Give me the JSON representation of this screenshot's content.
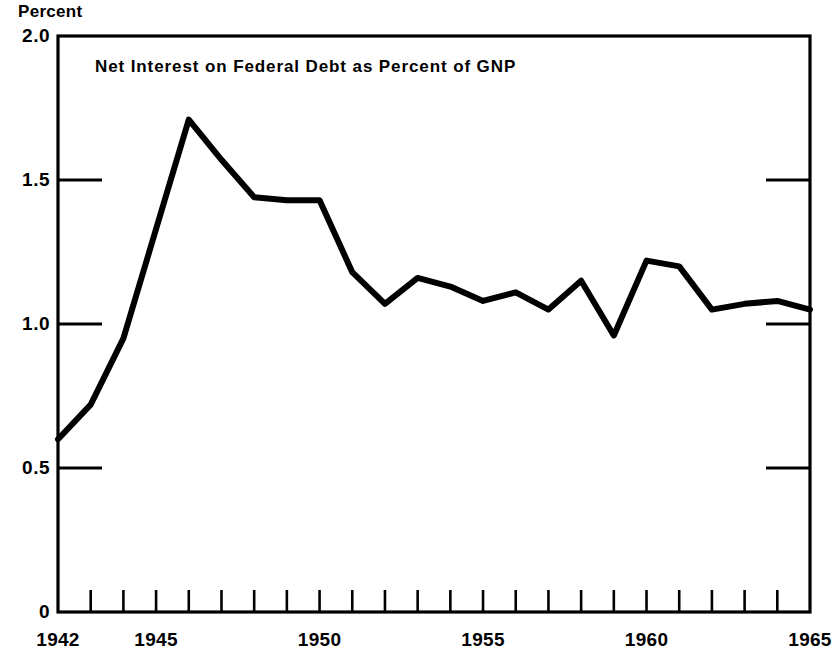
{
  "chart_data": {
    "type": "line",
    "title": "Net Interest on Federal Debt as Percent of GNP",
    "xlabel": "",
    "ylabel": "Percent",
    "ylim": [
      0,
      2.0
    ],
    "xlim": [
      1942,
      1965
    ],
    "grid": false,
    "legend": null,
    "y_ticks": [
      "2.0",
      "1.5",
      "1.0",
      "0.5",
      "0"
    ],
    "y_tick_values": [
      2.0,
      1.5,
      1.0,
      0.5,
      0
    ],
    "x_ticks": [
      "1942",
      "1945",
      "1950",
      "1955",
      "1960",
      "1965"
    ],
    "x_tick_values": [
      1942,
      1945,
      1950,
      1955,
      1960,
      1965
    ],
    "x_minor_tick_values": [
      1942,
      1943,
      1944,
      1945,
      1946,
      1947,
      1948,
      1949,
      1950,
      1951,
      1952,
      1953,
      1954,
      1955,
      1956,
      1957,
      1958,
      1959,
      1960,
      1961,
      1962,
      1963,
      1964,
      1965
    ],
    "line_color": "#000000",
    "series": [
      {
        "name": "Net Interest on Federal Debt as Percent of GNP",
        "x": [
          1942,
          1943,
          1944,
          1945,
          1946,
          1947,
          1948,
          1949,
          1950,
          1951,
          1952,
          1953,
          1954,
          1955,
          1956,
          1957,
          1958,
          1959,
          1960,
          1961,
          1962,
          1963,
          1964,
          1965
        ],
        "values": [
          0.6,
          0.72,
          0.95,
          1.33,
          1.71,
          1.57,
          1.44,
          1.43,
          1.43,
          1.18,
          1.07,
          1.16,
          1.13,
          1.08,
          1.11,
          1.05,
          1.15,
          0.96,
          1.22,
          1.2,
          1.05,
          1.07,
          1.08,
          1.05
        ]
      }
    ]
  },
  "labels": {
    "unit": "Percent",
    "title": "Net Interest on Federal Debt as Percent of GNP"
  }
}
